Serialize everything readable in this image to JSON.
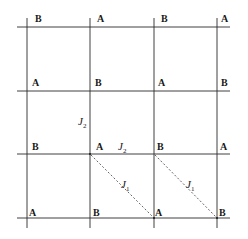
{
  "diagram": {
    "type": "square lattice with two sublattices A and B and exchange couplings",
    "line_color": "#2a2a2a",
    "dashed_color": "#555555",
    "grid": {
      "x": [
        27,
        90,
        154,
        217
      ],
      "y": [
        27,
        91,
        154,
        218
      ]
    },
    "rows": [
      [
        "B",
        "A",
        "B",
        "A"
      ],
      [
        "A",
        "B",
        "A",
        "B"
      ],
      [
        "B",
        "A",
        "B",
        "A"
      ],
      [
        "A",
        "B",
        "A",
        "B"
      ]
    ],
    "couplings": {
      "j2_vertical": {
        "label": "J",
        "sub": "2"
      },
      "j2_horizontal": {
        "label": "J",
        "sub": "2"
      },
      "j1_left": {
        "label": "J",
        "sub": "1"
      },
      "j1_right": {
        "label": "J",
        "sub": "1"
      }
    }
  }
}
